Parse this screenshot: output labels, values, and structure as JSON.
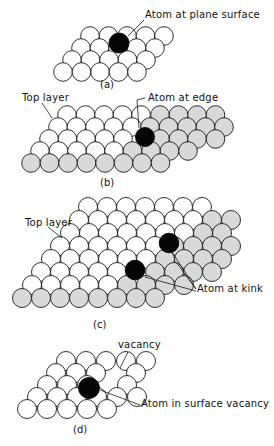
{
  "figure": {
    "colors": {
      "white_atom": "#ffffff",
      "shaded_atom": "#d9d9d9",
      "highlight_atom": "#050505",
      "outline": "#1a1a1a"
    },
    "panels": [
      {
        "id": "a",
        "caption": "(a)",
        "caption_pos": [
          78,
          80
        ],
        "labels": [
          {
            "text": "Atom at plane surface",
            "pos": [
              145,
              14
            ],
            "leader": [
              [
                144,
                20
              ],
              [
                128,
                36
              ]
            ]
          }
        ],
        "r": 9.3,
        "rows": [
          {
            "y": 72,
            "x0": 63,
            "dx": 18.5,
            "n": 5,
            "kind": "w"
          },
          {
            "y": 60,
            "x0": 72,
            "dx": 18.5,
            "n": 5,
            "kind": "w"
          },
          {
            "y": 48,
            "x0": 81,
            "dx": 18.5,
            "n": 5,
            "kind": "w"
          },
          {
            "y": 36,
            "x0": 90,
            "dx": 18.5,
            "n": 5,
            "kind": "w"
          }
        ],
        "special": [
          {
            "x": 119,
            "y": 43,
            "r": 10,
            "kind": "b"
          }
        ]
      },
      {
        "id": "b",
        "caption": "(b)",
        "caption_pos": [
          100,
          178
        ],
        "labels": [
          {
            "text": "Top layer",
            "pos": [
              22,
              93
            ],
            "leader": [
              [
                42,
                103
              ],
              [
                52,
                118
              ]
            ]
          },
          {
            "text": "Atom at edge",
            "pos": [
              148,
              93
            ],
            "leader": [
              [
                145,
                98
              ],
              [
                137,
                100
              ],
              [
                139,
                128
              ]
            ]
          }
        ],
        "r": 9.3,
        "rows": [
          {
            "y": 163,
            "x0": 31,
            "dx": 18.5,
            "n": 8,
            "kind": "g"
          },
          {
            "y": 151,
            "x0": 40,
            "dx": 18.5,
            "n": 5,
            "kind": "w"
          },
          {
            "y": 151,
            "x0": 132.5,
            "dx": 18.5,
            "n": 4,
            "kind": "g"
          },
          {
            "y": 139,
            "x0": 49,
            "dx": 18.5,
            "n": 5,
            "kind": "w"
          },
          {
            "y": 139,
            "x0": 160,
            "dx": 18.5,
            "n": 4,
            "kind": "g"
          },
          {
            "y": 127,
            "x0": 58,
            "dx": 18.5,
            "n": 5,
            "kind": "w"
          },
          {
            "y": 127,
            "x0": 150,
            "dx": 18.5,
            "n": 5,
            "kind": "g"
          },
          {
            "y": 115,
            "x0": 67,
            "dx": 18.5,
            "n": 5,
            "kind": "w"
          },
          {
            "y": 115,
            "x0": 160,
            "dx": 18.5,
            "n": 4,
            "kind": "g"
          }
        ],
        "special": [
          {
            "x": 145,
            "y": 137,
            "r": 9.5,
            "kind": "b"
          }
        ]
      },
      {
        "id": "c",
        "caption": "(c)",
        "caption_pos": [
          93,
          322
        ],
        "labels": [
          {
            "text": "Top layer",
            "pos": [
              25,
              218
            ],
            "leader": [
              [
                48,
                227
              ],
              [
                62,
                238
              ]
            ]
          },
          {
            "text": "Atom at kink",
            "pos": [
              196,
              288
            ],
            "leader": [
              [
                196,
                291
              ],
              [
                145,
                277
              ]
            ]
          }
        ],
        "leaders_extra": [
          [
            [
              196,
              289
            ],
            [
              172,
              252
            ]
          ],
          [
            [
              196,
              289
            ],
            [
              176,
              262
            ]
          ]
        ],
        "r": 9.5,
        "rows": [
          {
            "y": 298,
            "x0": 22,
            "dx": 19,
            "n": 8,
            "kind": "g"
          },
          {
            "y": 285,
            "x0": 32,
            "dx": 19,
            "n": 5,
            "kind": "w"
          },
          {
            "y": 285,
            "x0": 127,
            "dx": 19,
            "n": 4,
            "kind": "g"
          },
          {
            "y": 272,
            "x0": 41,
            "dx": 19,
            "n": 5,
            "kind": "w"
          },
          {
            "y": 272,
            "x0": 155,
            "dx": 19,
            "n": 4,
            "kind": "g"
          },
          {
            "y": 259,
            "x0": 51,
            "dx": 19,
            "n": 6,
            "kind": "w"
          },
          {
            "y": 259,
            "x0": 165,
            "dx": 19,
            "n": 4,
            "kind": "g"
          },
          {
            "y": 246,
            "x0": 60,
            "dx": 19,
            "n": 6,
            "kind": "w"
          },
          {
            "y": 246,
            "x0": 174,
            "dx": 19,
            "n": 4,
            "kind": "g"
          },
          {
            "y": 233,
            "x0": 70,
            "dx": 19,
            "n": 7,
            "kind": "w"
          },
          {
            "y": 233,
            "x0": 203,
            "dx": 19,
            "n": 2,
            "kind": "g"
          },
          {
            "y": 220,
            "x0": 79,
            "dx": 19,
            "n": 7,
            "kind": "w"
          },
          {
            "y": 220,
            "x0": 212,
            "dx": 19,
            "n": 2,
            "kind": "g"
          },
          {
            "y": 207,
            "x0": 88,
            "dx": 19,
            "n": 7,
            "kind": "w"
          }
        ],
        "special": [
          {
            "x": 135,
            "y": 270,
            "r": 9.8,
            "kind": "b"
          },
          {
            "x": 169,
            "y": 243,
            "r": 9.8,
            "kind": "b"
          }
        ]
      },
      {
        "id": "d",
        "caption": "(d)",
        "caption_pos": [
          73,
          427
        ],
        "labels": [
          {
            "text": "vacancy",
            "pos": [
              118,
              342
            ],
            "leader": [
              [
                128,
                352
              ],
              [
                120,
                368
              ]
            ]
          },
          {
            "text": "Atom in surface vacancy",
            "pos": [
              141,
              402
            ],
            "leader": [
              [
                140,
                405
              ],
              [
                100,
                390
              ]
            ]
          }
        ],
        "r": 9.5,
        "rows": [
          {
            "y": 409,
            "x0": 27,
            "dx": 20,
            "n": 5,
            "kind": "w"
          },
          {
            "y": 397,
            "x0": 37,
            "dx": 20,
            "n": 6,
            "kind": "w"
          },
          {
            "y": 385,
            "x0": 47,
            "dx": 20,
            "n": 3,
            "kind": "w"
          },
          {
            "y": 385,
            "x0": 127,
            "dx": 20,
            "n": 1,
            "kind": "w"
          },
          {
            "y": 373,
            "x0": 56,
            "dx": 20,
            "n": 3,
            "kind": "w"
          },
          {
            "y": 373,
            "x0": 136,
            "dx": 20,
            "n": 1,
            "kind": "w"
          },
          {
            "y": 361,
            "x0": 66,
            "dx": 20,
            "n": 5,
            "kind": "w"
          }
        ],
        "special": [
          {
            "x": 89,
            "y": 388,
            "r": 10.5,
            "kind": "b"
          }
        ]
      }
    ]
  }
}
